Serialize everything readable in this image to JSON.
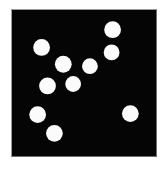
{
  "canvas": {
    "width": 165,
    "height": 173,
    "page_background": "#ffffff"
  },
  "panel": {
    "label": "dot-field-panel",
    "x": 11,
    "y": 9,
    "width": 146,
    "height": 148,
    "background_color": "#050505",
    "border_color": "#8a8a8a"
  },
  "chart_data": {
    "type": "scatter",
    "title": "",
    "subtitle": "",
    "xlabel": "",
    "ylabel": "",
    "xlim": [
      11,
      157
    ],
    "ylim": [
      9,
      157
    ],
    "grid": false,
    "legend": null,
    "point_color": "#fbfbfb",
    "background_color": "#050505",
    "count": 10,
    "series": [
      {
        "name": "dots",
        "marker": "circle",
        "points": [
          {
            "id": 1,
            "x": 113,
            "y": 29,
            "r": 8.5
          },
          {
            "id": 2,
            "x": 112,
            "y": 52,
            "r": 8.0
          },
          {
            "id": 3,
            "x": 41,
            "y": 47,
            "r": 8.5
          },
          {
            "id": 4,
            "x": 63,
            "y": 64,
            "r": 8.5
          },
          {
            "id": 5,
            "x": 90,
            "y": 66,
            "r": 8.0
          },
          {
            "id": 6,
            "x": 47,
            "y": 86,
            "r": 8.5
          },
          {
            "id": 7,
            "x": 73,
            "y": 84,
            "r": 8.0
          },
          {
            "id": 8,
            "x": 37,
            "y": 115,
            "r": 8.5
          },
          {
            "id": 9,
            "x": 54,
            "y": 134,
            "r": 8.5
          },
          {
            "id": 10,
            "x": 131,
            "y": 114,
            "r": 8.5
          }
        ]
      }
    ]
  }
}
